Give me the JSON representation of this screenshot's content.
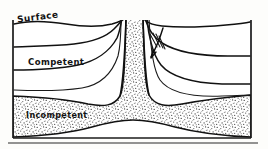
{
  "figure": {
    "background_color": "#fdfdfb",
    "ink_color": "#111111"
  },
  "labels": {
    "surface": "Surface",
    "competent": "Competent",
    "incompetent": "Incompetent"
  },
  "annotations": {
    "arrow_name": "down-drag-arrow",
    "arrow_direction": "down-left",
    "slip_tick_count": 4
  },
  "geometry": {
    "frame": {
      "left": 13,
      "right": 251,
      "top": 18,
      "bottom": 138
    },
    "strata_count": 4,
    "diapir_center_x": 133,
    "diapir_neck_top_y": 18,
    "incompetent_layer_base_y": 132
  },
  "colors": {
    "ink": "#111111",
    "stipple": "#4a4a4a",
    "paper": "#fdfdfb",
    "competent_fill": "#ffffff"
  }
}
